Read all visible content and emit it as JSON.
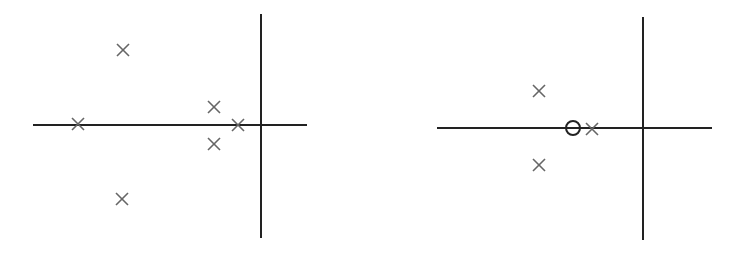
{
  "chart_data": [
    {
      "type": "scatter",
      "title": "",
      "description": "Pole-zero plot (s-plane), panel 1",
      "axes": {
        "real_axis": {
          "x1": 33,
          "x2": 307,
          "y": 125
        },
        "imag_axis": {
          "x": 261,
          "y1": 14,
          "y2": 238
        }
      },
      "poles": [
        {
          "x": 123,
          "y": 50
        },
        {
          "x": 78,
          "y": 124
        },
        {
          "x": 214,
          "y": 107
        },
        {
          "x": 214,
          "y": 144
        },
        {
          "x": 238,
          "y": 125
        },
        {
          "x": 122,
          "y": 199
        }
      ],
      "zeros": []
    },
    {
      "type": "scatter",
      "title": "",
      "description": "Pole-zero plot (s-plane), panel 2",
      "axes": {
        "real_axis": {
          "x1": 437,
          "x2": 712,
          "y": 128
        },
        "imag_axis": {
          "x": 643,
          "y1": 17,
          "y2": 240
        }
      },
      "poles": [
        {
          "x": 539,
          "y": 91
        },
        {
          "x": 539,
          "y": 165
        },
        {
          "x": 592,
          "y": 129
        }
      ],
      "zeros": [
        {
          "x": 573,
          "y": 128
        }
      ]
    }
  ],
  "style": {
    "axis_color": "#222222",
    "pole_color": "#666666",
    "zero_color": "#222222",
    "marker_half_size": 6,
    "zero_radius": 7
  }
}
